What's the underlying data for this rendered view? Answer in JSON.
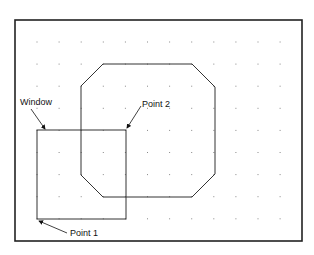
{
  "diagram": {
    "labels": {
      "window": "Window",
      "point1": "Point 1",
      "point2": "Point 2"
    },
    "grid": {
      "columns": 12,
      "rows": 9
    },
    "colors": {
      "frame": "#222222",
      "shape": "#333333",
      "dot": "#888888"
    }
  }
}
